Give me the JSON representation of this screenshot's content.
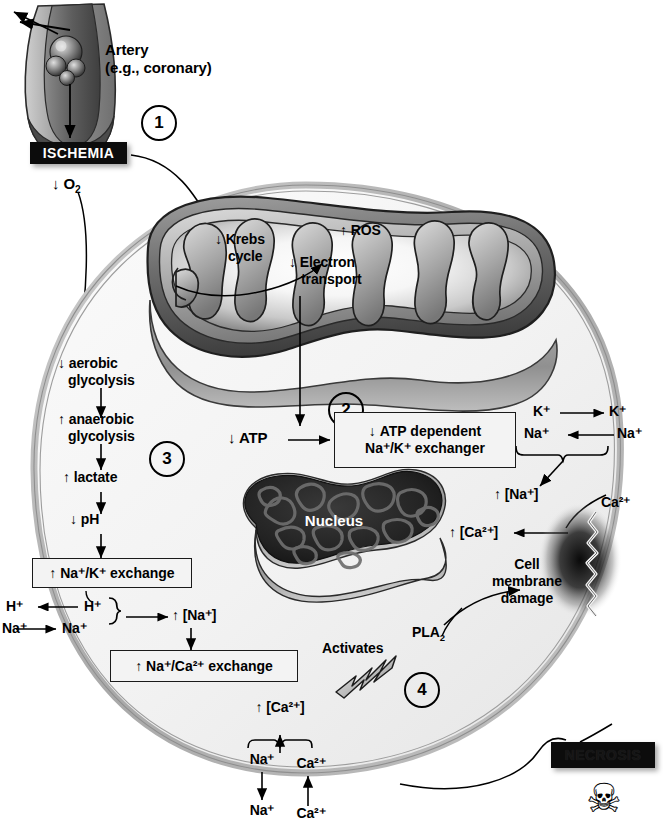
{
  "figure": {
    "caption": ""
  },
  "palette": {
    "ink": "#000000",
    "membrane_grey": "#b6b6b6",
    "cytoplasm": "#f2f2f2",
    "mito_dark": "#4a4a4a",
    "mito_mid": "#8c8c8c",
    "nucleus_dark": "#1a1a1a",
    "box_fill": "#f3f3f3",
    "black_box": "#0c0c0c"
  },
  "steps": [
    {
      "id": "step-1",
      "number": "1"
    },
    {
      "id": "step-2",
      "number": "2"
    },
    {
      "id": "step-3",
      "number": "3"
    },
    {
      "id": "step-4",
      "number": "4"
    }
  ],
  "artery": {
    "label_line1": "Artery",
    "label_line2": "(e.g., coronary)"
  },
  "ischemia": {
    "label": "ISCHEMIA",
    "oxygen": {
      "arrow": "↓",
      "text": "O",
      "sub": "2"
    }
  },
  "mitochondrion": {
    "krebs": {
      "arrow": "↓",
      "line1": "Krebs",
      "line2": "cycle"
    },
    "electron_transport": {
      "arrow": "↓",
      "line1": "Electron",
      "line2": "transport"
    },
    "ros": {
      "arrow": "↑",
      "text": "ROS"
    }
  },
  "glycolysis_cascade": [
    {
      "id": "aerobic-glycolysis",
      "arrow": "↓",
      "line1": "aerobic",
      "line2": "glycolysis"
    },
    {
      "id": "anaerobic-glycolysis",
      "arrow": "↑",
      "line1": "anaerobic",
      "line2": "glycolysis"
    },
    {
      "id": "lactate",
      "arrow": "↑",
      "line1": "lactate",
      "line2": ""
    },
    {
      "id": "ph",
      "arrow": "↓",
      "line1": "pH",
      "line2": ""
    }
  ],
  "boxes": {
    "na_k_exchange": {
      "arrow": "↑",
      "text": "Na⁺/K⁺ exchange"
    },
    "na_ca_exchange": {
      "arrow": "↑",
      "text": "Na⁺/Ca²⁺ exchange"
    },
    "atp_dependent": {
      "arrow": "↓",
      "line1": "ATP dependent",
      "line2": "Na⁺/K⁺ exchanger"
    }
  },
  "atp": {
    "arrow": "↓",
    "text": "ATP"
  },
  "nucleus": {
    "label": "Nucleus"
  },
  "left_exchange": {
    "h_out": "H⁺",
    "h_in": "H⁺",
    "na_out": "Na⁺",
    "na_in": "Na⁺",
    "result": {
      "arrow": "↑",
      "text": "[Na⁺]"
    }
  },
  "right_exchange": {
    "k_in": "K⁺",
    "k_out": "K⁺",
    "na_in": "Na⁺",
    "na_out": "Na⁺",
    "na_result": {
      "arrow": "↑",
      "text": "[Na⁺]"
    },
    "ca_result": {
      "arrow": "↑",
      "text": "[Ca²⁺]"
    },
    "ca_external": "Ca²⁺"
  },
  "bottom_exchange": {
    "result": {
      "arrow": "↑",
      "text": "[Ca²⁺]"
    },
    "na_inner": "Na⁺",
    "ca_inner": "Ca²⁺",
    "na_outer": "Na⁺",
    "ca_outer": "Ca²⁺"
  },
  "membrane_damage": {
    "line1": "Cell",
    "line2": "membrane",
    "line3": "damage"
  },
  "pla2": {
    "activates": "Activates",
    "enzyme": "PLA",
    "enzyme_sub": "2"
  },
  "necrosis": {
    "label": "NECROSIS",
    "icon": "skull-and-crossbones"
  }
}
